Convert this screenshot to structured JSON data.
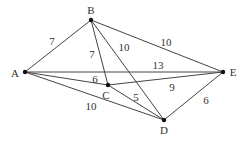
{
  "graph": {
    "nodes": [
      {
        "id": "A",
        "label": "A",
        "x": 25,
        "y": 72,
        "lx": 15,
        "ly": 73
      },
      {
        "id": "B",
        "label": "B",
        "x": 91,
        "y": 20,
        "lx": 91,
        "ly": 10
      },
      {
        "id": "C",
        "label": "C",
        "x": 108,
        "y": 85,
        "lx": 106,
        "ly": 95
      },
      {
        "id": "D",
        "label": "D",
        "x": 164,
        "y": 120,
        "lx": 164,
        "ly": 130
      },
      {
        "id": "E",
        "label": "E",
        "x": 223,
        "y": 72,
        "lx": 233,
        "ly": 72
      }
    ],
    "edges": [
      {
        "from": "A",
        "to": "B",
        "weight": "7",
        "lx": 52,
        "ly": 41
      },
      {
        "from": "B",
        "to": "C",
        "weight": "7",
        "lx": 92,
        "ly": 54
      },
      {
        "from": "B",
        "to": "D",
        "weight": "10",
        "lx": 124,
        "ly": 47
      },
      {
        "from": "B",
        "to": "E",
        "weight": "10",
        "lx": 166,
        "ly": 42
      },
      {
        "from": "A",
        "to": "E",
        "weight": "13",
        "lx": 158,
        "ly": 65
      },
      {
        "from": "A",
        "to": "C",
        "weight": "6",
        "lx": 95,
        "ly": 79
      },
      {
        "from": "C",
        "to": "E",
        "weight": "9",
        "lx": 172,
        "ly": 87
      },
      {
        "from": "C",
        "to": "D",
        "weight": "5",
        "lx": 136,
        "ly": 97
      },
      {
        "from": "A",
        "to": "D",
        "weight": "10",
        "lx": 91,
        "ly": 106
      },
      {
        "from": "D",
        "to": "E",
        "weight": "6",
        "lx": 206,
        "ly": 100
      }
    ]
  }
}
